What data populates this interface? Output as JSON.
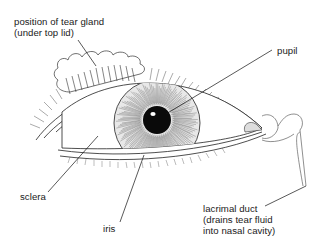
{
  "diagram": {
    "labels": {
      "tear_gland": {
        "line1": "position of tear gland",
        "line2": "(under top lid)"
      },
      "pupil": {
        "line1": "pupil"
      },
      "sclera": {
        "line1": "sclera"
      },
      "iris": {
        "line1": "iris"
      },
      "lacrimal_duct": {
        "line1": "lacrimal duct",
        "line2": "(drains tear fluid",
        "line3": "into nasal cavity)"
      }
    },
    "colors": {
      "ink": "#1a1a1a",
      "background": "#ffffff",
      "pupil": "#0a0a0a"
    }
  }
}
